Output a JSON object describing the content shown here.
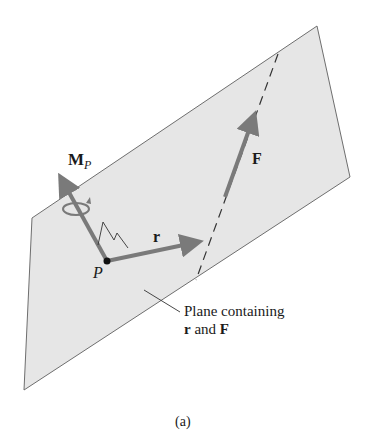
{
  "figure": {
    "caption": "(a)",
    "labels": {
      "moment": "M",
      "moment_sub": "P",
      "position_vector": "r",
      "force": "F",
      "point": "P",
      "plane_line1": "Plane containing",
      "plane_line2_r": "r",
      "plane_line2_and": " and ",
      "plane_line2_F": "F"
    },
    "colors": {
      "plane_fill": "#e6e6e6",
      "plane_edge": "#6e6e6e",
      "vector": "#7a7a7a",
      "text": "#1a1a1a"
    }
  }
}
